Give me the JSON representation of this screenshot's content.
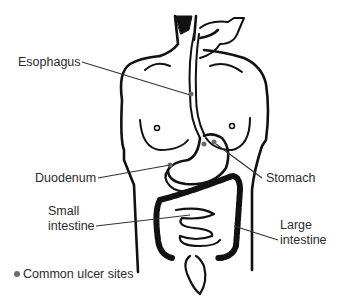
{
  "figure": {
    "type": "anatomical line drawing"
  },
  "labels": {
    "esophagus": "Esophagus",
    "duodenum": "Duodenum",
    "stomach": "Stomach",
    "small_intestine_line1": "Small",
    "small_intestine_line2": "intestine",
    "large_intestine_line1": "Large",
    "large_intestine_line2": "intestine"
  },
  "legend": {
    "marker": "gray dot",
    "text": "Common ulcer sites"
  },
  "colors": {
    "ink": "#111111",
    "label_text": "#2b2b2b",
    "ulcer_dot": "#6b6b6b",
    "leader_line": "#333333"
  }
}
